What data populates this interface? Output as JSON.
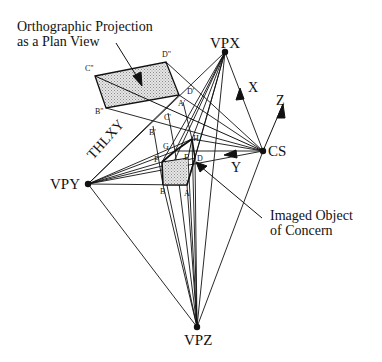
{
  "captions": {
    "plan_view_line1": "Orthographic Projection",
    "plan_view_line2": "as a Plan View",
    "object_line1": "Imaged Object",
    "object_line2": "of Concern"
  },
  "vanishing_points": {
    "vpx": "VPX",
    "vpy": "VPY",
    "vpz": "VPZ",
    "cs": "CS"
  },
  "axes": {
    "x": "X",
    "y": "Y",
    "z": "Z",
    "thl": "THLXY"
  },
  "vertices": {
    "c2": "C\"",
    "d2": "D\"",
    "b2": "B\"",
    "d1": "D'",
    "a1": "A'",
    "c1": "C'",
    "b1": "B'",
    "g": "G",
    "h": "H",
    "f": "F",
    "e": "E",
    "d": "D",
    "b": "B",
    "a": "A"
  },
  "colors": {
    "ink": "#111111",
    "shade": "#c8c8c8",
    "background": "#ffffff"
  }
}
